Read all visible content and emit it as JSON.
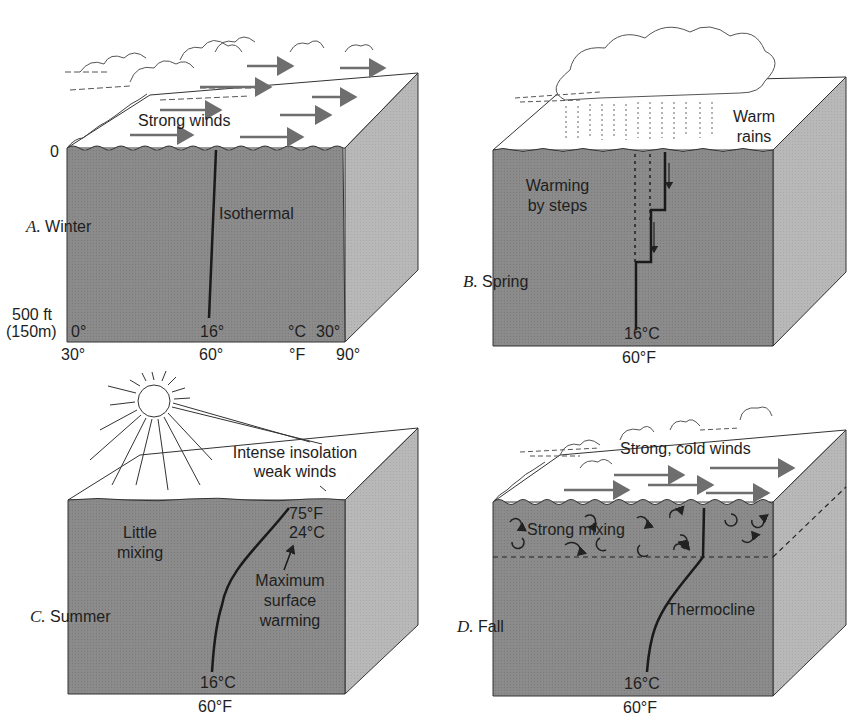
{
  "figure": {
    "colors": {
      "front_face": "#8b8b8b",
      "side_face": "#b8b8b8",
      "top_surface": "#ffffff",
      "lines": "#222222",
      "arrows": "#6e6e6e"
    },
    "panels": [
      {
        "id": "A",
        "letter": "A.",
        "season": "Winter",
        "surface_label": "Strong winds",
        "profile_label": "Isothermal",
        "depth_top": "0",
        "depth_bottom_1": "500 ft",
        "depth_bottom_2": "(150m)",
        "axis_c": {
          "min": "0°",
          "mid": "16°",
          "unit": "°C",
          "max": "30°"
        },
        "axis_f": {
          "min": "30°",
          "mid": "60°",
          "unit": "°F",
          "max": "90°"
        }
      },
      {
        "id": "B",
        "letter": "B.",
        "season": "Spring",
        "surface_label_1": "Warm",
        "surface_label_2": "rains",
        "process_label_1": "Warming",
        "process_label_2": "by steps",
        "bottom_c": "16°C",
        "bottom_f": "60°F"
      },
      {
        "id": "C",
        "letter": "C.",
        "season": "Summer",
        "surface_label_1": "Intense insolation",
        "surface_label_2": "weak winds",
        "mixing_label_1": "Little",
        "mixing_label_2": "mixing",
        "top_f": "75°F",
        "top_c": "24°C",
        "note_1": "Maximum",
        "note_2": "surface",
        "note_3": "warming",
        "bottom_c": "16°C",
        "bottom_f": "60°F"
      },
      {
        "id": "D",
        "letter": "D.",
        "season": "Fall",
        "surface_label": "Strong, cold winds",
        "mixing_label": "Strong mixing",
        "profile_label": "Thermocline",
        "bottom_c": "16°C",
        "bottom_f": "60°F"
      }
    ]
  }
}
